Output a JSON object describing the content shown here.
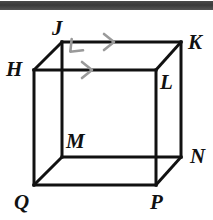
{
  "figure": {
    "kind": "geometry-diagram",
    "shape_name": "cube",
    "width": 213,
    "height": 220,
    "background_color": "#ffffff",
    "edge_color": "#111111",
    "tick_mark_color": "#9a9a9a",
    "scan_artifact": {
      "name": "top-scan-bar",
      "color": "#3f3f3f",
      "x": 0,
      "y": 1,
      "width": 213,
      "height": 9
    },
    "vertices": [
      {
        "id": "J",
        "label": "J",
        "x": 62,
        "y": 42,
        "label_x": 52,
        "label_y": 18,
        "hidden": false
      },
      {
        "id": "K",
        "label": "K",
        "x": 181,
        "y": 42,
        "label_x": 188,
        "label_y": 32,
        "hidden": false
      },
      {
        "id": "H",
        "label": "H",
        "x": 34,
        "y": 70,
        "label_x": 6,
        "label_y": 59,
        "hidden": false
      },
      {
        "id": "L",
        "label": "L",
        "x": 156,
        "y": 70,
        "label_x": 160,
        "label_y": 72,
        "hidden": false
      },
      {
        "id": "M",
        "label": "M",
        "x": 62,
        "y": 157,
        "label_x": 66,
        "label_y": 131,
        "hidden": false
      },
      {
        "id": "N",
        "label": "N",
        "x": 181,
        "y": 157,
        "label_x": 190,
        "label_y": 146,
        "hidden": false
      },
      {
        "id": "Q",
        "label": "Q",
        "x": 34,
        "y": 185,
        "label_x": 14,
        "label_y": 192,
        "hidden": false
      },
      {
        "id": "P",
        "label": "P",
        "x": 156,
        "y": 185,
        "label_x": 150,
        "label_y": 192,
        "hidden": false
      }
    ],
    "edges": [
      {
        "name": "edge-J-K",
        "from": "J",
        "to": "K",
        "style": "solid"
      },
      {
        "name": "edge-J-H",
        "from": "J",
        "to": "H",
        "style": "solid"
      },
      {
        "name": "edge-J-M",
        "from": "J",
        "to": "M",
        "style": "solid"
      },
      {
        "name": "edge-K-L",
        "from": "K",
        "to": "L",
        "style": "solid"
      },
      {
        "name": "edge-K-N",
        "from": "K",
        "to": "N",
        "style": "solid"
      },
      {
        "name": "edge-H-L",
        "from": "H",
        "to": "L",
        "style": "solid"
      },
      {
        "name": "edge-H-Q",
        "from": "H",
        "to": "Q",
        "style": "solid"
      },
      {
        "name": "edge-L-P",
        "from": "L",
        "to": "P",
        "style": "solid"
      },
      {
        "name": "edge-M-N",
        "from": "M",
        "to": "N",
        "style": "solid"
      },
      {
        "name": "edge-M-Q",
        "from": "M",
        "to": "Q",
        "style": "solid"
      },
      {
        "name": "edge-Q-P",
        "from": "Q",
        "to": "P",
        "style": "solid"
      },
      {
        "name": "edge-N-P",
        "from": "N",
        "to": "P",
        "style": "solid"
      }
    ],
    "arrow_marks": [
      {
        "name": "arrow-on-edge-JK",
        "x": 113,
        "y": 42,
        "angle": 0,
        "meaning": "parallel-direction-marker"
      },
      {
        "name": "arrow-on-edge-HL",
        "x": 91,
        "y": 70,
        "angle": 0,
        "meaning": "parallel-direction-marker"
      },
      {
        "name": "arrow-on-edge-JH",
        "x": 71,
        "y": 51,
        "angle": 135,
        "meaning": "parallel-direction-marker"
      }
    ]
  }
}
